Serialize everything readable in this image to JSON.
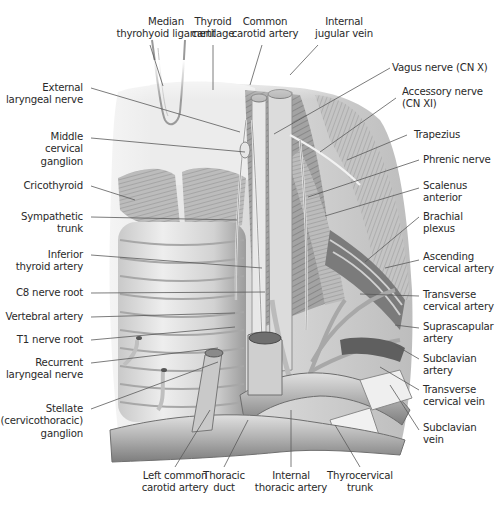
{
  "figure": {
    "type": "anatomical illustration",
    "colors": {
      "text": "#2a2a2a",
      "leader": "#555555",
      "background": "#ffffff"
    }
  },
  "labels": {
    "top": [
      {
        "id": "median-thyrohyoid-ligament",
        "lines": [
          "Median",
          "thyrohyoid ligament"
        ]
      },
      {
        "id": "thyroid-cartilage",
        "lines": [
          "Thyroid",
          "cartilage"
        ]
      },
      {
        "id": "common-carotid-artery",
        "lines": [
          "Common",
          "carotid artery"
        ]
      },
      {
        "id": "internal-jugular-vein",
        "lines": [
          "Internal",
          "jugular vein"
        ]
      }
    ],
    "left": [
      {
        "id": "external-laryngeal-nerve",
        "lines": [
          "External",
          "laryngeal nerve"
        ]
      },
      {
        "id": "middle-cervical-ganglion",
        "lines": [
          "Middle",
          "cervical",
          "ganglion"
        ]
      },
      {
        "id": "cricothyroid",
        "lines": [
          "Cricothyroid"
        ]
      },
      {
        "id": "sympathetic-trunk",
        "lines": [
          "Sympathetic",
          "trunk"
        ]
      },
      {
        "id": "inferior-thyroid-artery",
        "lines": [
          "Inferior",
          "thyroid artery"
        ]
      },
      {
        "id": "c8-nerve-root",
        "lines": [
          "C8 nerve root"
        ]
      },
      {
        "id": "vertebral-artery",
        "lines": [
          "Vertebral artery"
        ]
      },
      {
        "id": "t1-nerve-root",
        "lines": [
          "T1 nerve root"
        ]
      },
      {
        "id": "recurrent-laryngeal-nerve",
        "lines": [
          "Recurrent",
          "laryngeal nerve"
        ]
      },
      {
        "id": "stellate-ganglion",
        "lines": [
          "Stellate",
          "(cervicothoracic)",
          "ganglion"
        ]
      }
    ],
    "right": [
      {
        "id": "vagus-nerve",
        "lines": [
          "Vagus nerve (CN X)"
        ]
      },
      {
        "id": "accessory-nerve",
        "lines": [
          "Accessory nerve",
          "(CN XI)"
        ]
      },
      {
        "id": "trapezius",
        "lines": [
          "Trapezius"
        ]
      },
      {
        "id": "phrenic-nerve",
        "lines": [
          "Phrenic nerve"
        ]
      },
      {
        "id": "scalenus-anterior",
        "lines": [
          "Scalenus",
          "anterior"
        ]
      },
      {
        "id": "brachial-plexus",
        "lines": [
          "Brachial",
          "plexus"
        ]
      },
      {
        "id": "ascending-cervical-artery",
        "lines": [
          "Ascending",
          "cervical artery"
        ]
      },
      {
        "id": "transverse-cervical-artery",
        "lines": [
          "Transverse",
          "cervical artery"
        ]
      },
      {
        "id": "suprascapular-artery",
        "lines": [
          "Suprascapular",
          "artery"
        ]
      },
      {
        "id": "subclavian-artery",
        "lines": [
          "Subclavian",
          "artery"
        ]
      },
      {
        "id": "transverse-cervical-vein",
        "lines": [
          "Transverse",
          "cervical vein"
        ]
      },
      {
        "id": "subclavian-vein",
        "lines": [
          "Subclavian",
          "vein"
        ]
      }
    ],
    "bottom": [
      {
        "id": "left-common-carotid-artery",
        "lines": [
          "Left common",
          "carotid artery"
        ]
      },
      {
        "id": "thoracic-duct",
        "lines": [
          "Thoracic",
          "duct"
        ]
      },
      {
        "id": "internal-thoracic-artery",
        "lines": [
          "Internal",
          "thoracic artery"
        ]
      },
      {
        "id": "thyrocervical-trunk",
        "lines": [
          "Thyrocervical",
          "trunk"
        ]
      }
    ]
  }
}
